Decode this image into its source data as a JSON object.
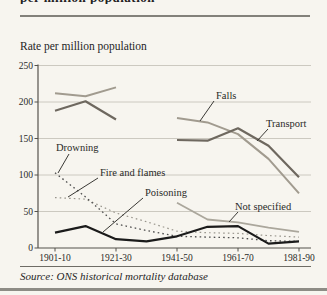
{
  "page": {
    "cropped_heading_fragment": "per million population",
    "axis_title": "Rate per million population",
    "source": "Source: ONS historical mortality database"
  },
  "chart_data": {
    "type": "line",
    "title": "Rate per million population",
    "categories": [
      "1901-10",
      "1911-20",
      "1921-30",
      "1931-40",
      "1941-50",
      "1951-60",
      "1961-70",
      "1971-80",
      "1981-90"
    ],
    "x_tick_labels": [
      "1901-10",
      "1921-30",
      "1941-50",
      "1961-70",
      "1981-90"
    ],
    "ylabel": "Rate per million population",
    "ylim": [
      0,
      250
    ],
    "y_ticks": [
      0,
      50,
      100,
      150,
      200,
      250
    ],
    "grid": true,
    "legend_position": "inline-annotations",
    "note": "Falls and Transport series have a data gap for 1931-40",
    "series": [
      {
        "name": "Falls",
        "style": "solid",
        "color": "#a19b8f",
        "width": 2,
        "values": [
          212,
          208,
          220,
          null,
          178,
          172,
          156,
          122,
          75
        ]
      },
      {
        "name": "Transport",
        "style": "solid",
        "color": "#6e685f",
        "width": 2.2,
        "values": [
          188,
          201,
          176,
          null,
          148,
          147,
          164,
          140,
          97
        ]
      },
      {
        "name": "Not specified",
        "style": "solid",
        "color": "#aba79c",
        "width": 1.8,
        "values": [
          null,
          null,
          null,
          null,
          62,
          39,
          35,
          28,
          22
        ]
      },
      {
        "name": "Fire and flames",
        "style": "dotted",
        "color": "#98958c",
        "width": 1.2,
        "values": [
          69,
          67,
          48,
          36,
          23,
          21,
          20,
          17,
          15
        ]
      },
      {
        "name": "Drowning",
        "style": "dotted",
        "color": "#4d4d4d",
        "width": 1.3,
        "values": [
          103,
          70,
          33,
          24,
          16,
          15,
          14,
          10,
          9
        ]
      },
      {
        "name": "Poisoning",
        "style": "solid",
        "color": "#1b1b1b",
        "width": 2.2,
        "values": [
          21,
          30,
          12,
          9,
          16,
          29,
          30,
          6,
          9
        ]
      }
    ],
    "annotations": [
      {
        "text": "Falls",
        "tx": 216,
        "ty": 99,
        "lx1": 214,
        "ly1": 101,
        "lx2": 200,
        "ly2": 121
      },
      {
        "text": "Transport",
        "tx": 266,
        "ty": 127,
        "lx1": 268,
        "ly1": 129,
        "lx2": 257,
        "ly2": 141
      },
      {
        "text": "Drowning",
        "tx": 56,
        "ty": 151,
        "lx1": 69,
        "ly1": 154,
        "lx2": 58,
        "ly2": 173
      },
      {
        "text": "Fire and flames",
        "tx": 100,
        "ty": 176,
        "lx1": 98,
        "ly1": 178,
        "lx2": 68,
        "ly2": 197
      },
      {
        "text": "Poisoning",
        "tx": 145,
        "ty": 196,
        "lx1": 143,
        "ly1": 198,
        "lx2": 103,
        "ly2": 232
      },
      {
        "text": "Not specified",
        "tx": 235,
        "ty": 210,
        "lx1": 238,
        "ly1": 212,
        "lx2": 229,
        "ly2": 222
      }
    ]
  }
}
